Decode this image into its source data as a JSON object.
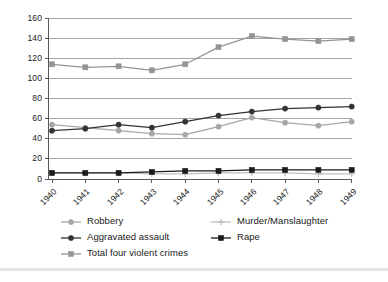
{
  "chart_data": {
    "type": "line",
    "title": "",
    "subtitle": "",
    "xlabel": "",
    "ylabel": "",
    "categories": [
      "1940",
      "1941",
      "1942",
      "1943",
      "1944",
      "1945",
      "1946",
      "1947",
      "1948",
      "1949"
    ],
    "ylim": [
      0,
      160
    ],
    "ytick_values": [
      0,
      20,
      40,
      60,
      80,
      100,
      120,
      140,
      160
    ],
    "ytick_labels": [
      "0",
      "20",
      "40",
      "60",
      "80",
      "100",
      "120",
      "140",
      "160"
    ],
    "grid": "horizontal",
    "legend_position": "bottom",
    "series": [
      {
        "name": "Robbery",
        "color": "#a6a6a6",
        "marker": "circle",
        "values": [
          54,
          51,
          48,
          45,
          44,
          52,
          61,
          56,
          53,
          57
        ]
      },
      {
        "name": "Murder/Manslaughter",
        "color": "#bfbfbf",
        "marker": "plus",
        "values": [
          6,
          6,
          6,
          5,
          5,
          6,
          6,
          6,
          5,
          5
        ]
      },
      {
        "name": "Aggravated assault",
        "color": "#333333",
        "marker": "circle",
        "values": [
          48,
          50,
          54,
          51,
          57,
          63,
          67,
          70,
          71,
          72
        ]
      },
      {
        "name": "Rape",
        "color": "#1a1a1a",
        "marker": "square",
        "values": [
          6,
          6,
          6,
          7,
          8,
          8,
          9,
          9,
          9,
          9
        ]
      },
      {
        "name": "Total four violent crimes",
        "color": "#949494",
        "marker": "square",
        "values": [
          114,
          111,
          112,
          108,
          114,
          131,
          142,
          139,
          137,
          139
        ]
      }
    ]
  },
  "axes": {
    "grid_color": "#808080",
    "axis_color": "#595959",
    "plot_background": "#ffffff"
  },
  "legend": {
    "entries": [
      {
        "label": "Robbery",
        "series": "Robbery"
      },
      {
        "label": "Murder/Manslaughter",
        "series": "Murder/Manslaughter"
      },
      {
        "label": "Aggravated assault",
        "series": "Aggravated assault"
      },
      {
        "label": "Rape",
        "series": "Rape"
      },
      {
        "label": "Total four violent crimes",
        "series": "Total four violent crimes"
      }
    ]
  }
}
